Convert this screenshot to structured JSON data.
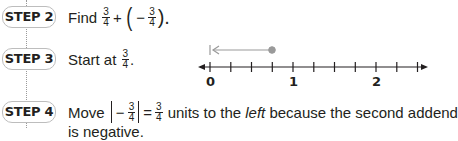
{
  "steps": [
    {
      "badge": "STEP 2",
      "text_prefix": "Find",
      "frac1": {
        "num": "3",
        "den": "4"
      },
      "plus": "+",
      "open_paren": "(",
      "minus": "−",
      "frac2": {
        "num": "3",
        "den": "4"
      },
      "close_paren": ").",
      "full_text": "Find 3/4 + (−3/4)."
    },
    {
      "badge": "STEP 3",
      "text_prefix": "Start at",
      "frac": {
        "num": "3",
        "den": "4"
      },
      "suffix": ".",
      "full_text": "Start at 3/4."
    },
    {
      "badge": "STEP 4",
      "text_prefix": "Move",
      "abs_minus": "−",
      "abs_frac": {
        "num": "3",
        "den": "4"
      },
      "equals": "=",
      "frac": {
        "num": "3",
        "den": "4"
      },
      "text_mid": "units to the",
      "emphasis": "left",
      "text_suffix": "because the second addend",
      "text_cutoff": "is negative.",
      "full_text": "Move |−3/4| = 3/4 units to the left because the second addend is negative."
    }
  ],
  "number_line": {
    "labels": [
      "0",
      "1",
      "2"
    ],
    "ticks_per_unit": 4,
    "start_point": "3/4",
    "end_point": "0",
    "arrow_direction": "left",
    "colors": {
      "axis": "#231f20",
      "arrow": "#9a9a9a"
    }
  }
}
